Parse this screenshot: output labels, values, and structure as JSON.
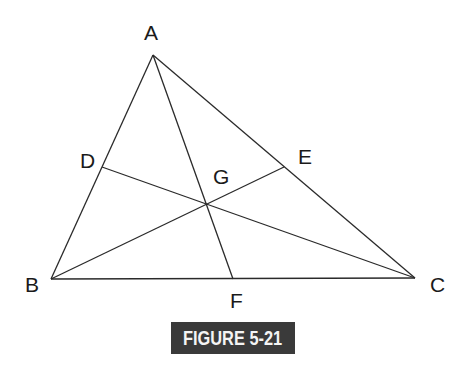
{
  "figure": {
    "caption": "FIGURE 5-21",
    "badge_color": "#3a3a3a",
    "line_color": "#2a2a2a"
  },
  "points": {
    "A": {
      "label": "A",
      "x": 153,
      "y": 55
    },
    "B": {
      "label": "B",
      "x": 51,
      "y": 279
    },
    "C": {
      "label": "C",
      "x": 415,
      "y": 278
    },
    "D": {
      "label": "D",
      "x": 102,
      "y": 167
    },
    "E": {
      "label": "E",
      "x": 284,
      "y": 167
    },
    "F": {
      "label": "F",
      "x": 233,
      "y": 279
    },
    "G": {
      "label": "G",
      "x": 206,
      "y": 205
    }
  },
  "segments": [
    [
      "A",
      "B"
    ],
    [
      "B",
      "C"
    ],
    [
      "C",
      "A"
    ],
    [
      "A",
      "F"
    ],
    [
      "B",
      "E"
    ],
    [
      "C",
      "D"
    ]
  ]
}
